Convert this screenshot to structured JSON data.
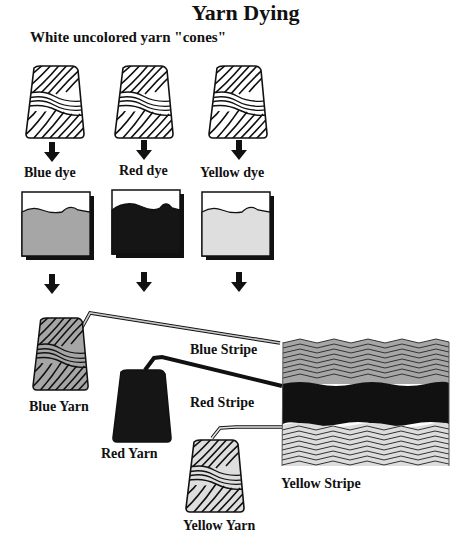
{
  "title": "Yarn Dying",
  "subtitle": "White uncolored yarn \"cones\"",
  "dyes": [
    {
      "label": "Blue dye",
      "fill": "#a6a6a6"
    },
    {
      "label": "Red dye",
      "fill": "#151515"
    },
    {
      "label": "Yellow dye",
      "fill": "#dedede"
    }
  ],
  "yarns": [
    {
      "label": "Blue Yarn",
      "fill": "#a6a6a6"
    },
    {
      "label": "Red Yarn",
      "fill": "#151515"
    },
    {
      "label": "Yellow Yarn",
      "fill": "#dedede"
    }
  ],
  "stripes": [
    {
      "label": "Blue Stripe"
    },
    {
      "label": "Red Stripe"
    },
    {
      "label": "Yellow Stripe"
    }
  ]
}
